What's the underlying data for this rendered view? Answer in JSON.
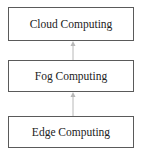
{
  "diagram": {
    "type": "layered-stack",
    "direction": "bottom-to-top",
    "nodes": [
      {
        "id": "cloud",
        "label": "Cloud Computing"
      },
      {
        "id": "fog",
        "label": "Fog Computing"
      },
      {
        "id": "edge",
        "label": "Edge Computing"
      }
    ],
    "edges": [
      {
        "from": "edge",
        "to": "fog"
      },
      {
        "from": "fog",
        "to": "cloud"
      }
    ],
    "colors": {
      "box_border": "#5a5a5a",
      "arrow": "#b8b8b8",
      "text": "#222222",
      "background": "#ffffff"
    }
  }
}
